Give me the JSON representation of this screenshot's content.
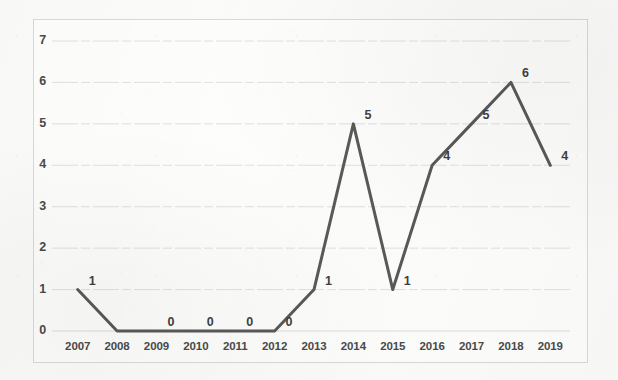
{
  "chart_data": {
    "type": "line",
    "title": "",
    "subtitle": "",
    "xlabel": "",
    "ylabel": "",
    "categories": [
      "2007",
      "2008",
      "2009",
      "2010",
      "2011",
      "2012",
      "2013",
      "2014",
      "2015",
      "2016",
      "2017",
      "2018",
      "2019"
    ],
    "values": [
      1,
      0,
      0,
      0,
      0,
      0,
      1,
      5,
      1,
      4,
      5,
      6,
      4
    ],
    "data_labels": [
      "1",
      "0",
      "0",
      "0",
      "0",
      "0",
      "1",
      "5",
      "1",
      "4",
      "5",
      "6",
      "4"
    ],
    "data_label_visible": [
      true,
      false,
      true,
      true,
      true,
      true,
      true,
      true,
      true,
      true,
      true,
      true,
      true
    ],
    "ylim": [
      0,
      7
    ],
    "yticks": [
      "0",
      "1",
      "2",
      "3",
      "4",
      "5",
      "6",
      "7"
    ],
    "ytick_values": [
      0,
      1,
      2,
      3,
      4,
      5,
      6,
      7
    ],
    "grid": true,
    "grid_axis": "y",
    "legend": false,
    "legend_position": "none",
    "series": [
      {
        "name": "Publications",
        "values": [
          1,
          0,
          0,
          0,
          0,
          0,
          1,
          5,
          1,
          4,
          5,
          6,
          4
        ],
        "color": "#595959",
        "marker": "none",
        "line_width": 3
      }
    ]
  },
  "style": {
    "line_color": "#595959",
    "grid_color": "#dcdcdc",
    "frame_color": "#d9d9d7",
    "text_color": "#4a4a4a",
    "background_color": "#fdfdfc"
  }
}
